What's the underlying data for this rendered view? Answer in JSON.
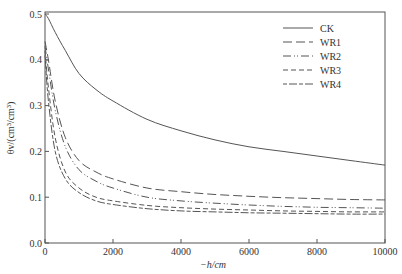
{
  "chart_data": {
    "type": "line",
    "title": "",
    "xlabel": "−h/cm",
    "ylabel": "θv/(cm³/cm³)",
    "xlim": [
      0,
      10000
    ],
    "ylim": [
      0.0,
      0.5
    ],
    "xticks": [
      0,
      2000,
      4000,
      6000,
      8000,
      10000
    ],
    "yticks": [
      0.0,
      0.1,
      0.2,
      0.3,
      0.4,
      0.5
    ],
    "xtick_labels": [
      "0",
      "2000",
      "4000",
      "6000",
      "8000",
      "10000"
    ],
    "ytick_labels": [
      "0.0",
      "0.1",
      "0.2",
      "0.3",
      "0.4",
      "0.5"
    ],
    "grid": false,
    "legend_position": "top-right",
    "x": [
      0,
      100,
      300,
      600,
      1000,
      1500,
      2000,
      3000,
      4000,
      5000,
      6000,
      7000,
      8000,
      9000,
      10000
    ],
    "series": [
      {
        "name": "CK",
        "style": "solid",
        "values": [
          0.5,
          0.49,
          0.46,
          0.42,
          0.37,
          0.335,
          0.31,
          0.27,
          0.245,
          0.225,
          0.21,
          0.2,
          0.19,
          0.18,
          0.17
        ]
      },
      {
        "name": "WR1",
        "style": "long-dash",
        "values": [
          0.44,
          0.4,
          0.31,
          0.23,
          0.18,
          0.155,
          0.14,
          0.12,
          0.112,
          0.106,
          0.102,
          0.099,
          0.097,
          0.095,
          0.094
        ]
      },
      {
        "name": "WR2",
        "style": "dash-dot-dot",
        "values": [
          0.43,
          0.38,
          0.29,
          0.21,
          0.16,
          0.135,
          0.12,
          0.1,
          0.092,
          0.087,
          0.083,
          0.08,
          0.078,
          0.077,
          0.076
        ]
      },
      {
        "name": "WR3",
        "style": "dash",
        "values": [
          0.42,
          0.34,
          0.23,
          0.155,
          0.12,
          0.1,
          0.092,
          0.082,
          0.077,
          0.074,
          0.072,
          0.07,
          0.069,
          0.068,
          0.068
        ]
      },
      {
        "name": "WR4",
        "style": "short-long",
        "values": [
          0.41,
          0.31,
          0.2,
          0.14,
          0.11,
          0.092,
          0.084,
          0.075,
          0.07,
          0.068,
          0.066,
          0.065,
          0.064,
          0.063,
          0.063
        ]
      }
    ]
  }
}
